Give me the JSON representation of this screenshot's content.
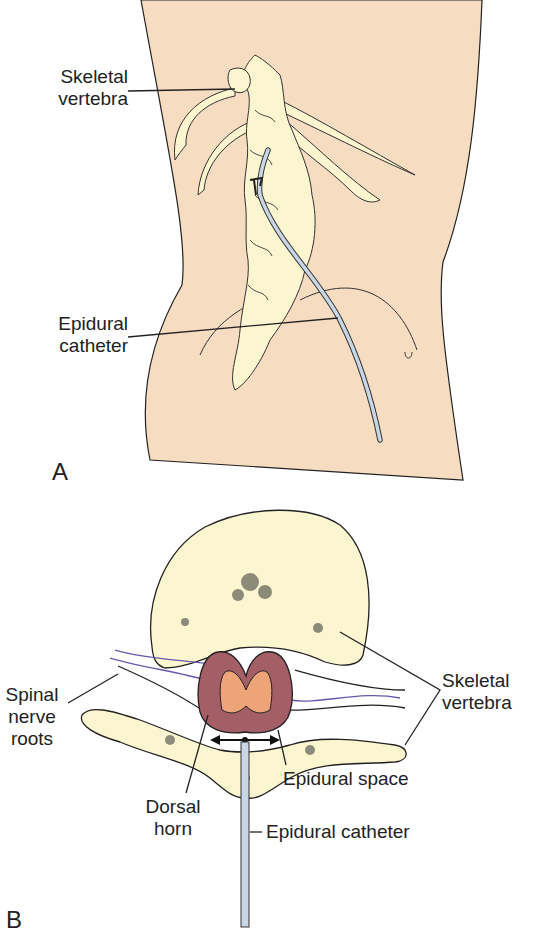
{
  "figure": {
    "panel_a": {
      "letter": "A",
      "labels": {
        "skeletal_vertebra": "Skeletal\nvertebra",
        "epidural_catheter": "Epidural\ncatheter"
      }
    },
    "panel_b": {
      "letter": "B",
      "labels": {
        "spinal_nerve_roots": "Spinal\nnerve\nroots",
        "dorsal_horn": "Dorsal\nhorn",
        "epidural_space": "Epidural space",
        "epidural_catheter": "Epidural catheter",
        "skeletal_vertebra": "Skeletal\nvertebra"
      }
    },
    "colors": {
      "skin": "#f6dcc0",
      "bone": "#fbf6d0",
      "cord_outer": "#a35e66",
      "cord_inner": "#eda479",
      "nerve": "#6a58b0",
      "catheter": "#c8d6e6",
      "line": "#222222"
    }
  }
}
